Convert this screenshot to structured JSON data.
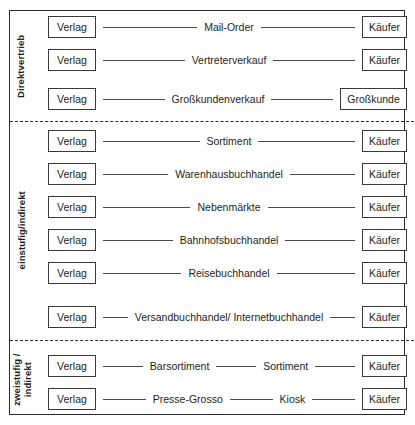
{
  "diagram": {
    "source_node_label": "Verlag",
    "groups": [
      {
        "id": "direktvertrieb",
        "label": "Direktvertrieb",
        "rows": [
          {
            "source": "Verlag",
            "labels": [
              "Mail-Order"
            ],
            "target": "Käufer",
            "target_wide": false
          },
          {
            "source": "Verlag",
            "labels": [
              "Vertreterverkauf"
            ],
            "target": "Käufer",
            "target_wide": false
          },
          {
            "source": "Verlag",
            "labels": [
              "Großkundenverkauf"
            ],
            "target": "Großkunde",
            "target_wide": true
          }
        ]
      },
      {
        "id": "einstufig-indirekt",
        "label": "einstufig/indirekt",
        "rows": [
          {
            "source": "Verlag",
            "labels": [
              "Sortiment"
            ],
            "target": "Käufer",
            "target_wide": false
          },
          {
            "source": "Verlag",
            "labels": [
              "Warenhausbuchhandel"
            ],
            "target": "Käufer",
            "target_wide": false
          },
          {
            "source": "Verlag",
            "labels": [
              "Nebenmärkte"
            ],
            "target": "Käufer",
            "target_wide": false
          },
          {
            "source": "Verlag",
            "labels": [
              "Bahnhofsbuchhandel"
            ],
            "target": "Käufer",
            "target_wide": false
          },
          {
            "source": "Verlag",
            "labels": [
              "Reisebuchhandel"
            ],
            "target": "Käufer",
            "target_wide": false
          },
          {
            "source": "Verlag",
            "labels": [
              "Versandbuchhandel/ Internetbuchhandel"
            ],
            "target": "Käufer",
            "target_wide": false
          }
        ]
      },
      {
        "id": "zweistufig-indirekt",
        "label": "zweistufig /\nindirekt",
        "rows": [
          {
            "source": "Verlag",
            "labels": [
              "Barsortiment",
              "Sortiment"
            ],
            "target": "Käufer",
            "target_wide": false
          },
          {
            "source": "Verlag",
            "labels": [
              "Presse-Grosso",
              "Kiosk"
            ],
            "target": "Käufer",
            "target_wide": false
          }
        ]
      }
    ]
  }
}
